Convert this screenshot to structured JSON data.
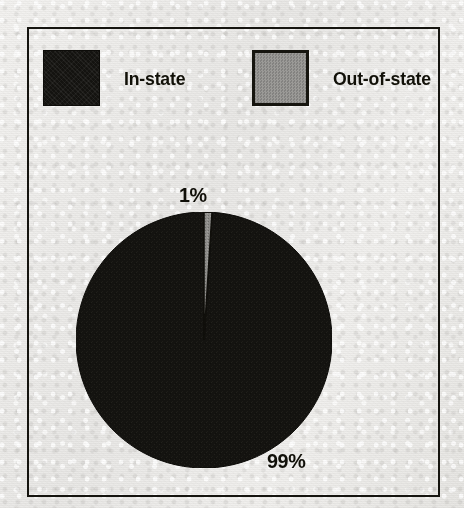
{
  "chart_data": {
    "type": "pie",
    "title": "",
    "subtitle": "",
    "xlabel": "",
    "ylabel": "",
    "legend_position": "top",
    "grid": false,
    "categories": [
      "In-state",
      "Out-of-state"
    ],
    "values": [
      99,
      1
    ],
    "unit": "%",
    "slices": [
      {
        "label": "In-state",
        "value": 99,
        "value_label": "99%",
        "color": "#141310",
        "start_angle_deg": 3.6,
        "end_angle_deg": 360
      },
      {
        "label": "Out-of-state",
        "value": 1,
        "value_label": "1%",
        "color": "#8e8d8a",
        "start_angle_deg": 0,
        "end_angle_deg": 3.6
      }
    ],
    "legend": [
      {
        "label": "In-state",
        "color": "#141310",
        "swatch": "solid-black"
      },
      {
        "label": "Out-of-state",
        "color": "#8e8d8a",
        "swatch": "gray-outlined"
      }
    ],
    "annotations": [
      {
        "text": "1%",
        "position": "above-top-of-pie"
      },
      {
        "text": "99%",
        "position": "lower-right-outside-pie"
      }
    ]
  },
  "legend": {
    "in_state": {
      "label": "In-state",
      "color": "#141310"
    },
    "out_of_state": {
      "label": "Out-of-state",
      "color": "#8e8d8a"
    }
  },
  "labels": {
    "slice_small": "1%",
    "slice_large": "99%"
  },
  "colors": {
    "background": "#eeedeb",
    "frame": "#15140f",
    "ink": "#111008",
    "in_state": "#141310",
    "out_of_state": "#8e8d8a"
  }
}
